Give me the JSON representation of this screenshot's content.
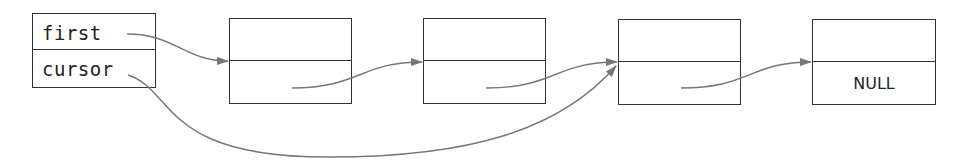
{
  "diagram": {
    "type": "linked-list",
    "colors": {
      "box_border": "#333333",
      "arrow": "#777777",
      "text": "#222222",
      "background": "#ffffff"
    },
    "pointer_box": {
      "fields": [
        {
          "label": "first",
          "points_to": "node-1"
        },
        {
          "label": "cursor",
          "points_to": "node-3"
        }
      ]
    },
    "nodes": [
      {
        "id": "node-1",
        "data": "",
        "next": "",
        "next_target": "node-2"
      },
      {
        "id": "node-2",
        "data": "",
        "next": "",
        "next_target": "node-3"
      },
      {
        "id": "node-3",
        "data": "",
        "next": "",
        "next_target": "node-4"
      },
      {
        "id": "node-4",
        "data": "",
        "next": "NULL",
        "next_target": null
      }
    ]
  }
}
